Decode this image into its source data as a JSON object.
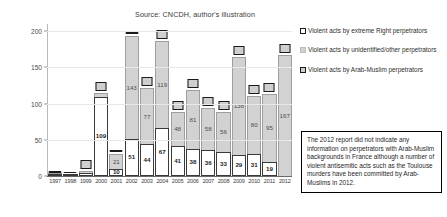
{
  "chart_data": {
    "type": "bar",
    "title": "Source: CNCDH, author's illustration",
    "xlabel": "",
    "ylabel": "",
    "ylim": [
      0,
      210
    ],
    "yticks": [
      0,
      50,
      100,
      150,
      200
    ],
    "grid": true,
    "legend_position": "right",
    "categories": [
      "1997",
      "1998",
      "1999",
      "2000",
      "2001",
      "2002",
      "2003",
      "2004",
      "2005",
      "2006",
      "2007",
      "2008",
      "2009",
      "2010",
      "2011",
      "2012"
    ],
    "series": [
      {
        "name": "Violent acts by extreme Right perpetrators",
        "values": [
          1,
          1,
          4,
          109,
          10,
          51,
          44,
          67,
          41,
          38,
          36,
          33,
          29,
          31,
          19,
          0
        ]
      },
      {
        "name": "Violent acts by unidentified/other perpetrators",
        "values": [
          1,
          0,
          3,
          6,
          21,
          143,
          77,
          119,
          48,
          81,
          58,
          56,
          136,
          80,
          95,
          167
        ]
      },
      {
        "name": "Violent acts by Arab-Muslim perpetrators",
        "values": [
          null,
          null,
          null,
          null,
          null,
          null,
          null,
          null,
          null,
          null,
          null,
          null,
          null,
          null,
          null,
          null
        ]
      }
    ],
    "bar_labels": {
      "other": [
        "",
        "",
        "",
        "",
        "21",
        "143",
        "77",
        "119",
        "48",
        "81",
        "58",
        "56",
        "138",
        "80",
        "95",
        "167"
      ],
      "right": [
        "",
        "",
        "",
        "109",
        "10",
        "51",
        "44",
        "67",
        "41",
        "38",
        "36",
        "33",
        "29",
        "31",
        "19",
        ""
      ]
    },
    "markers": [
      {
        "year": "1997",
        "style": "flat",
        "label": ""
      },
      {
        "year": "1998",
        "style": "flat",
        "label": ""
      },
      {
        "year": "1999",
        "style": "box",
        "label": ""
      },
      {
        "year": "2000",
        "style": "box",
        "label": ""
      },
      {
        "year": "2001",
        "style": "flat",
        "label": ""
      },
      {
        "year": "2002",
        "style": "flat",
        "label": ""
      },
      {
        "year": "2003",
        "style": "box",
        "label": ""
      },
      {
        "year": "2004",
        "style": "box",
        "label": ""
      },
      {
        "year": "2005",
        "style": "box",
        "label": ""
      },
      {
        "year": "2006",
        "style": "box",
        "label": ""
      },
      {
        "year": "2007",
        "style": "box",
        "label": ""
      },
      {
        "year": "2008",
        "style": "box",
        "label": ""
      },
      {
        "year": "2009",
        "style": "box",
        "label": ""
      },
      {
        "year": "2010",
        "style": "box",
        "label": ""
      },
      {
        "year": "2011",
        "style": "box",
        "label": ""
      },
      {
        "year": "2012",
        "style": "box",
        "label": ""
      }
    ]
  },
  "legend": {
    "items": [
      {
        "swatch": "sw-right",
        "label": "Violent acts by extreme Right perpetrators"
      },
      {
        "swatch": "sw-other",
        "label": "Violent acts by unidentified/other perpetrators"
      },
      {
        "swatch": "sw-arab",
        "label": "Violent acts by Arab-Muslim perpetrators"
      }
    ]
  },
  "note": {
    "text": "The 2012 report did not indicate any information on perpetrators with Arab-Muslim backgrounds in France although a number of violent antisemitic acts such as the Toulouse murders have been committed by Arab-Muslims in 2012."
  }
}
